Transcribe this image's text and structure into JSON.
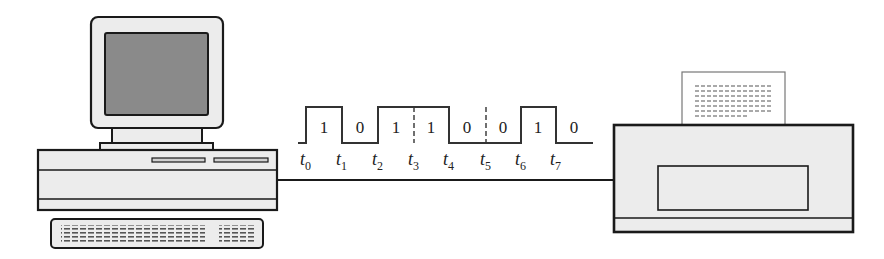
{
  "diagram": {
    "colors": {
      "stroke": "#1a1a1a",
      "body_fill": "#ececec",
      "screen_fill": "#8a8a8a",
      "paper_fill": "#ffffff",
      "signal": "#333333"
    },
    "computer": {
      "label": "computer"
    },
    "printer": {
      "label": "printer"
    },
    "signal": {
      "bits": [
        "1",
        "0",
        "1",
        "1",
        "0",
        "0",
        "1",
        "0"
      ],
      "time_labels": [
        {
          "base": "t",
          "sub": "0"
        },
        {
          "base": "t",
          "sub": "1"
        },
        {
          "base": "t",
          "sub": "2"
        },
        {
          "base": "t",
          "sub": "3"
        },
        {
          "base": "t",
          "sub": "4"
        },
        {
          "base": "t",
          "sub": "5"
        },
        {
          "base": "t",
          "sub": "6"
        },
        {
          "base": "t",
          "sub": "7"
        }
      ]
    }
  }
}
